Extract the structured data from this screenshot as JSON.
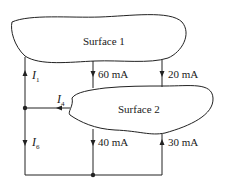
{
  "diagram": {
    "surfaces": [
      {
        "id": "surface1",
        "label": "Surface 1"
      },
      {
        "id": "surface2",
        "label": "Surface 2"
      }
    ],
    "currents": [
      {
        "id": "I1",
        "symbol": "I",
        "subscript": "1",
        "direction": "up"
      },
      {
        "id": "I4",
        "symbol": "I",
        "subscript": "4",
        "direction": "left"
      },
      {
        "id": "I6",
        "symbol": "I",
        "subscript": "6",
        "direction": "down"
      },
      {
        "id": "c60",
        "label": "60 mA",
        "direction": "down"
      },
      {
        "id": "c20",
        "label": "20 mA",
        "direction": "down"
      },
      {
        "id": "c40",
        "label": "40 mA",
        "direction": "down"
      },
      {
        "id": "c30",
        "label": "30 mA",
        "direction": "up"
      }
    ]
  }
}
